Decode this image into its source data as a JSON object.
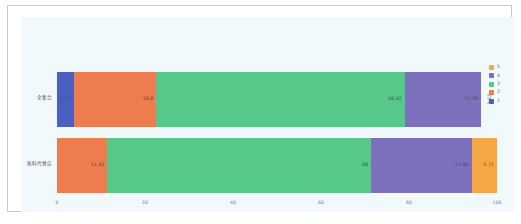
{
  "chart_data": {
    "type": "bar",
    "orientation": "horizontal",
    "stacked": true,
    "title": "",
    "xlabel": "",
    "ylabel": "",
    "xlim": [
      0,
      100
    ],
    "xticks": [
      "0",
      "20",
      "40",
      "60",
      "80",
      "100"
    ],
    "grid": false,
    "legend_position": "right",
    "categories": [
      "全集合",
      "無料代替店"
    ],
    "series": [
      {
        "name": "1",
        "color": "#4a5fc1",
        "values": [
          3.77,
          0
        ]
      },
      {
        "name": "2",
        "color": "#ed7d4f",
        "values": [
          18.8,
          11.43
        ]
      },
      {
        "name": "3",
        "color": "#55c88a",
        "values": [
          56.42,
          60
        ]
      },
      {
        "name": "4",
        "color": "#7d70bd",
        "values": [
          17.38,
          22.86
        ]
      },
      {
        "name": "5",
        "color": "#f3a martial",
        "values": [
          3.63,
          5.71
        ]
      }
    ],
    "rows": [
      {
        "label": "全集合",
        "segments": [
          {
            "series": "1",
            "value": 3.77,
            "label": "3.77",
            "color": "#4a5fc1",
            "rotated": false
          },
          {
            "series": "2",
            "value": 18.8,
            "label": "18.8",
            "color": "#ed7d4f",
            "rotated": false
          },
          {
            "series": "3",
            "value": 56.42,
            "label": "56.42",
            "color": "#55c88a",
            "rotated": false
          },
          {
            "series": "4",
            "value": 17.38,
            "label": "17.38",
            "color": "#7d70bd",
            "rotated": false
          },
          {
            "series": "5",
            "value": 3.63,
            "label": "3.63",
            "color": "#f4a košice",
            "rotated": true
          }
        ]
      },
      {
        "label": "無料代替店",
        "segments": [
          {
            "series": "1",
            "value": 0,
            "label": "",
            "color": "#4a5fc1",
            "rotated": false
          },
          {
            "series": "2",
            "value": 11.43,
            "label": "11.43",
            "color": "#ed7d4f",
            "rotated": false
          },
          {
            "series": "3",
            "value": 60,
            "label": "60",
            "color": "#55c88a",
            "rotated": false
          },
          {
            "series": "4",
            "value": 22.86,
            "label": "22.86",
            "color": "#7d70bd",
            "rotated": false
          },
          {
            "series": "5",
            "value": 5.71,
            "label": "5.71",
            "color": "#f4a742",
            "rotated": false
          }
        ]
      }
    ],
    "legend": [
      {
        "name": "5",
        "color": "#f4a742"
      },
      {
        "name": "4",
        "color": "#7d70bd"
      },
      {
        "name": "3",
        "color": "#55c88a"
      },
      {
        "name": "2",
        "color": "#ed7d4f"
      },
      {
        "name": "1",
        "color": "#4a5fc1"
      }
    ]
  }
}
